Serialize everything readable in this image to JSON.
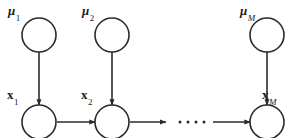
{
  "figure": {
    "kind": "probabilistic-graphical-model",
    "width": 299,
    "height": 138,
    "background_color": "#ffffff",
    "stroke_color": "#2b2b2b",
    "node_fill_color": "#ffffff"
  },
  "nodes": {
    "top_row": [
      {
        "id": "mu1",
        "symbol": "μ",
        "subscript": "1",
        "cx": 39,
        "cy": 35,
        "r": 17
      },
      {
        "id": "mu2",
        "symbol": "μ",
        "subscript": "2",
        "cx": 112,
        "cy": 35,
        "r": 17
      },
      {
        "id": "muM",
        "symbol": "μ",
        "subscript": "M",
        "cx": 267,
        "cy": 35,
        "r": 17
      }
    ],
    "bottom_row": [
      {
        "id": "x1",
        "symbol": "x",
        "subscript": "1",
        "cx": 39,
        "cy": 122,
        "r": 17
      },
      {
        "id": "x2",
        "symbol": "x",
        "subscript": "2",
        "cx": 112,
        "cy": 122,
        "r": 17
      },
      {
        "id": "xM",
        "symbol": "x",
        "subscript": "M",
        "cx": 267,
        "cy": 122,
        "r": 17
      }
    ]
  },
  "labels": {
    "mu1": {
      "symbol": "μ",
      "subscript": "1",
      "subscript_italic": false
    },
    "mu2": {
      "symbol": "μ",
      "subscript": "2",
      "subscript_italic": false
    },
    "muM": {
      "symbol": "μ",
      "subscript": "M",
      "subscript_italic": true
    },
    "x1": {
      "symbol": "x",
      "subscript": "1",
      "subscript_italic": false
    },
    "x2": {
      "symbol": "x",
      "subscript": "2",
      "subscript_italic": false
    },
    "xM": {
      "symbol": "x",
      "subscript": "M",
      "subscript_italic": true
    }
  },
  "edges": {
    "vertical": [
      {
        "id": "mu1-to-x1",
        "from": "mu1",
        "to": "x1",
        "x": 39,
        "y1": 52,
        "y2": 105
      },
      {
        "id": "mu2-to-x2",
        "from": "mu2",
        "to": "x2",
        "x": 112,
        "y1": 52,
        "y2": 105
      },
      {
        "id": "muM-to-xM",
        "from": "muM",
        "to": "xM",
        "x": 267,
        "y1": 52,
        "y2": 105
      }
    ],
    "horizontal": [
      {
        "id": "x1-to-x2",
        "from": "x1",
        "to": "x2",
        "y": 122,
        "x1": 57,
        "x2": 95
      },
      {
        "id": "x2-to-dots",
        "from": "x2",
        "to": "ellipsis",
        "y": 122,
        "x1": 130,
        "x2": 166
      },
      {
        "id": "dots-to-xM",
        "from": "ellipsis",
        "to": "xM",
        "y": 122,
        "x1": 213,
        "x2": 250
      }
    ]
  },
  "ellipsis": {
    "id": "chain-ellipsis",
    "dot_count": 4,
    "dots": [
      {
        "cx": 180,
        "cy": 122
      },
      {
        "cx": 188,
        "cy": 122
      },
      {
        "cx": 196,
        "cy": 122
      },
      {
        "cx": 204,
        "cy": 122
      }
    ]
  }
}
